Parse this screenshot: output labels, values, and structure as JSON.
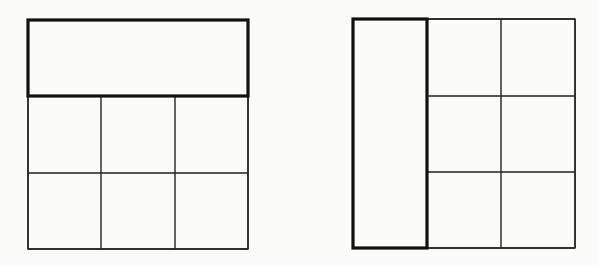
{
  "diagram": {
    "colors": {
      "background": "#fbfbfa",
      "stroke": "#222222",
      "bold_stroke": "#111111"
    },
    "figures": [
      {
        "id": "left",
        "merged_region": "top row (3 cells merged horizontally)",
        "bounds": {
          "x": 28,
          "y": 20,
          "w": 220,
          "h": 229
        },
        "bold_rect": {
          "x": 28,
          "y": 20,
          "w": 220,
          "h": 76
        },
        "grid": {
          "cols": [
            28,
            101,
            175,
            248
          ],
          "rows": [
            96,
            173,
            249
          ]
        }
      },
      {
        "id": "right",
        "merged_region": "left column (3 cells merged vertically)",
        "bounds": {
          "x": 353,
          "y": 19,
          "w": 222,
          "h": 229
        },
        "bold_rect": {
          "x": 353,
          "y": 19,
          "w": 74,
          "h": 229
        },
        "grid": {
          "cols": [
            427,
            501,
            575
          ],
          "rows": [
            19,
            96,
            172,
            248
          ]
        }
      }
    ]
  }
}
